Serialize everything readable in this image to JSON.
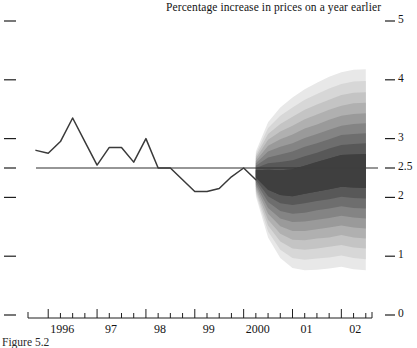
{
  "chart_data": {
    "type": "area",
    "title": "Percentage increase in prices on a year earlier",
    "caption": "Figure 5.2",
    "xlabel": "",
    "ylabel": "",
    "ylim": [
      0,
      5
    ],
    "xlim": [
      1995.75,
      2002.75
    ],
    "grid": false,
    "legend_position": "none",
    "y_ticks": [
      {
        "value": 5,
        "label": "5"
      },
      {
        "value": 4,
        "label": "4"
      },
      {
        "value": 3,
        "label": "3"
      },
      {
        "value": 2.5,
        "label": "2.5"
      },
      {
        "value": 2,
        "label": "2"
      },
      {
        "value": 1,
        "label": "1"
      },
      {
        "value": 0,
        "label": "0"
      }
    ],
    "x_year_ticks": [
      {
        "value": 1996,
        "label": "1996"
      },
      {
        "value": 1997,
        "label": "97"
      },
      {
        "value": 1998,
        "label": "98"
      },
      {
        "value": 1999,
        "label": "99"
      },
      {
        "value": 2000,
        "label": "2000"
      },
      {
        "value": 2001,
        "label": "01"
      },
      {
        "value": 2002,
        "label": "02"
      }
    ],
    "x_minor_ticks": [
      1996.0,
      1996.25,
      1996.5,
      1996.75,
      1997.0,
      1997.25,
      1997.5,
      1997.75,
      1998.0,
      1998.25,
      1998.5,
      1998.75,
      1999.0,
      1999.25,
      1999.5,
      1999.75,
      2000.0,
      2000.25,
      2000.5,
      2000.75,
      2001.0,
      2001.25,
      2001.5,
      2001.75,
      2002.0,
      2002.25,
      2002.5
    ],
    "target_line": {
      "value": 2.5,
      "label": "2.5"
    },
    "series": [
      {
        "name": "History",
        "type": "line",
        "color": "#3a3a3a",
        "x": [
          1995.75,
          1996.0,
          1996.25,
          1996.5,
          1996.75,
          1997.0,
          1997.25,
          1997.5,
          1997.75,
          1998.0,
          1998.25,
          1998.5,
          1998.75,
          1999.0,
          1999.25,
          1999.5,
          1999.75,
          2000.0,
          2000.25
        ],
        "values": [
          2.8,
          2.75,
          2.95,
          3.35,
          2.95,
          2.55,
          2.85,
          2.85,
          2.6,
          3.0,
          2.5,
          2.5,
          2.3,
          2.1,
          2.1,
          2.15,
          2.35,
          2.5,
          2.3
        ]
      },
      {
        "name": "Forecast fan",
        "type": "fan",
        "x": [
          2000.25,
          2000.5,
          2000.75,
          2001.0,
          2001.25,
          2001.5,
          2001.75,
          2002.0,
          2002.25,
          2002.5
        ],
        "central": [
          2.4,
          2.3,
          2.25,
          2.25,
          2.3,
          2.35,
          2.4,
          2.45,
          2.45,
          2.45
        ],
        "bands": [
          {
            "probability": 10,
            "shade": "#3f3f3f",
            "lower": [
              2.34,
              2.13,
              2.04,
              2.02,
              2.06,
              2.1,
              2.14,
              2.18,
              2.17,
              2.16
            ],
            "upper": [
              2.46,
              2.47,
              2.46,
              2.48,
              2.54,
              2.6,
              2.66,
              2.72,
              2.73,
              2.74
            ]
          },
          {
            "probability": 20,
            "shade": "#585858",
            "lower": [
              2.3,
              2.02,
              1.9,
              1.87,
              1.9,
              1.94,
              1.97,
              2.01,
              1.99,
              1.98
            ],
            "upper": [
              2.5,
              2.58,
              2.6,
              2.63,
              2.7,
              2.76,
              2.83,
              2.89,
              2.91,
              2.92
            ]
          },
          {
            "probability": 30,
            "shade": "#6e6e6e",
            "lower": [
              2.26,
              1.92,
              1.77,
              1.72,
              1.74,
              1.78,
              1.81,
              1.85,
              1.82,
              1.81
            ],
            "upper": [
              2.54,
              2.68,
              2.73,
              2.78,
              2.86,
              2.92,
              2.99,
              3.06,
              3.08,
              3.09
            ]
          },
          {
            "probability": 40,
            "shade": "#848484",
            "lower": [
              2.22,
              1.82,
              1.64,
              1.58,
              1.59,
              1.62,
              1.65,
              1.69,
              1.66,
              1.64
            ],
            "upper": [
              2.58,
              2.78,
              2.86,
              2.92,
              3.01,
              3.08,
              3.15,
              3.22,
              3.25,
              3.26
            ]
          },
          {
            "probability": 50,
            "shade": "#9a9a9a",
            "lower": [
              2.18,
              1.72,
              1.51,
              1.43,
              1.43,
              1.46,
              1.49,
              1.52,
              1.49,
              1.47
            ],
            "upper": [
              2.62,
              2.88,
              2.99,
              3.07,
              3.17,
              3.24,
              3.32,
              3.39,
              3.42,
              3.43
            ]
          },
          {
            "probability": 60,
            "shade": "#b0b0b0",
            "lower": [
              2.14,
              1.62,
              1.38,
              1.28,
              1.27,
              1.3,
              1.32,
              1.36,
              1.32,
              1.3
            ],
            "upper": [
              2.66,
              2.98,
              3.12,
              3.22,
              3.33,
              3.41,
              3.49,
              3.56,
              3.6,
              3.61
            ]
          },
          {
            "probability": 70,
            "shade": "#c4c4c4",
            "lower": [
              2.1,
              1.52,
              1.25,
              1.13,
              1.11,
              1.13,
              1.16,
              1.19,
              1.15,
              1.13
            ],
            "upper": [
              2.7,
              3.08,
              3.25,
              3.37,
              3.49,
              3.58,
              3.66,
              3.74,
              3.78,
              3.79
            ]
          },
          {
            "probability": 80,
            "shade": "#d7d7d7",
            "lower": [
              2.06,
              1.42,
              1.11,
              0.97,
              0.94,
              0.96,
              0.98,
              1.01,
              0.97,
              0.95
            ],
            "upper": [
              2.74,
              3.18,
              3.39,
              3.53,
              3.66,
              3.76,
              3.85,
              3.93,
              3.97,
              3.98
            ]
          },
          {
            "probability": 90,
            "shade": "#e8e8e8",
            "lower": [
              2.02,
              1.32,
              0.97,
              0.8,
              0.76,
              0.77,
              0.79,
              0.82,
              0.78,
              0.76
            ],
            "upper": [
              2.78,
              3.28,
              3.53,
              3.7,
              3.84,
              3.95,
              4.05,
              4.13,
              4.17,
              4.18
            ]
          }
        ]
      }
    ]
  }
}
